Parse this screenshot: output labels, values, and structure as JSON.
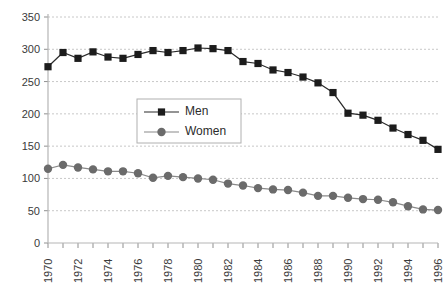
{
  "chart_data": {
    "type": "line",
    "title": "",
    "subtitle": "",
    "xlabel": "",
    "ylabel": "",
    "x": [
      1970,
      1971,
      1972,
      1973,
      1974,
      1975,
      1976,
      1977,
      1978,
      1979,
      1980,
      1981,
      1982,
      1983,
      1984,
      1985,
      1986,
      1987,
      1988,
      1989,
      1990,
      1991,
      1992,
      1993,
      1994,
      1995,
      1996
    ],
    "xlim": [
      1970,
      1996
    ],
    "ylim": [
      0,
      350
    ],
    "yticks": [
      0,
      50,
      100,
      150,
      200,
      250,
      300,
      350
    ],
    "xticks_labeled": [
      1970,
      1972,
      1974,
      1976,
      1978,
      1980,
      1982,
      1984,
      1986,
      1988,
      1990,
      1992,
      1994,
      1996
    ],
    "grid": true,
    "grid_style": "dashed-horizontal",
    "legend_position": "center",
    "series": [
      {
        "name": "Men",
        "marker": "square",
        "color": "#1c1c1c",
        "values": [
          273,
          295,
          286,
          296,
          288,
          286,
          292,
          298,
          295,
          298,
          302,
          301,
          298,
          281,
          278,
          268,
          264,
          257,
          248,
          233,
          201,
          198,
          190,
          178,
          168,
          159,
          145
        ]
      },
      {
        "name": "Women",
        "marker": "circle",
        "color": "#6b6b6b",
        "values": [
          115,
          121,
          117,
          114,
          111,
          111,
          108,
          101,
          104,
          102,
          100,
          98,
          92,
          89,
          85,
          83,
          82,
          78,
          73,
          73,
          70,
          68,
          67,
          63,
          57,
          52,
          51
        ]
      }
    ]
  },
  "legend": {
    "entries": [
      {
        "label": "Men"
      },
      {
        "label": "Women"
      }
    ]
  },
  "axis": {
    "y_tick_labels": [
      "350",
      "300",
      "250",
      "200",
      "150",
      "100",
      "50",
      "0"
    ],
    "x_tick_labels": [
      "1970",
      "1972",
      "1974",
      "1976",
      "1978",
      "1980",
      "1982",
      "1984",
      "1986",
      "1988",
      "1990",
      "1992",
      "1994",
      "1996"
    ]
  },
  "colors": {
    "men": "#1c1c1c",
    "women": "#6b6b6b",
    "grid": "#c8c8c8",
    "axis": "#b5b5b5",
    "text": "#3a3a3a",
    "background": "#ffffff"
  }
}
